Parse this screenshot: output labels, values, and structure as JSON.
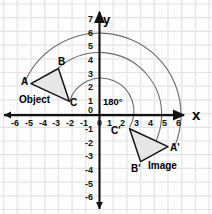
{
  "diagram": {
    "title_visible": false,
    "type": "coordinate-plane-rotation",
    "axes": {
      "x_label": "x",
      "y_label": "y",
      "x_ticks": [
        "-6",
        "-5",
        "-4",
        "-3",
        "-2",
        "-1",
        "0",
        "1",
        "2",
        "3",
        "4",
        "5",
        "6"
      ],
      "y_ticks_positive": [
        "7",
        "6",
        "5",
        "4",
        "3",
        "2",
        "1",
        "0"
      ],
      "y_ticks_negative": [
        "-1",
        "-2",
        "-3",
        "-4",
        "-5",
        "-6"
      ],
      "origin_label": "0",
      "axis_color": "#111111",
      "grid_color": "#e2e2e2"
    },
    "angle_label": "180°",
    "object": {
      "caption": "Object",
      "vertices": [
        {
          "name": "A",
          "x": -5.0,
          "y": 2.3
        },
        {
          "name": "B",
          "x": -3.0,
          "y": 3.4
        },
        {
          "name": "C",
          "x": -2.2,
          "y": 1.0
        }
      ],
      "fill": "#e8e8e8",
      "stroke": "#1a1a1a"
    },
    "image": {
      "caption": "Image",
      "vertices": [
        {
          "name": "A'",
          "x": 5.0,
          "y": -2.3
        },
        {
          "name": "B'",
          "x": 3.0,
          "y": -3.4
        },
        {
          "name": "C'",
          "x": 2.2,
          "y": -1.0
        }
      ],
      "fill": "#e8e8e8",
      "stroke": "#1a1a1a"
    },
    "arcs": [
      {
        "name": "arc-A-to-Aprime",
        "radius": 5.5,
        "from": "A",
        "to": "A'"
      },
      {
        "name": "arc-B-to-Bprime",
        "radius": 4.5,
        "from": "B",
        "to": "B'"
      },
      {
        "name": "arc-C-to-Cprime",
        "radius": 2.4,
        "from": "C",
        "to": "C'"
      }
    ]
  }
}
